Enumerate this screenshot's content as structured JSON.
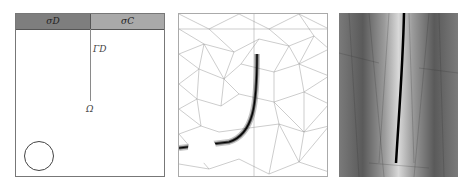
{
  "figure": {
    "panels": [
      {
        "id": "geometry",
        "description": "Domain geometry with boundary bands and crack line",
        "labels": {
          "band_left": "σD",
          "band_right": "σC",
          "crack": "ΓD",
          "domain": "Ω"
        }
      },
      {
        "id": "mesh",
        "description": "Adaptive triangular mesh refined along curved crack path from circular hole"
      },
      {
        "id": "field",
        "description": "Grayscale field plot with refined mesh along near-vertical crack"
      }
    ],
    "colors": {
      "band_dark": "#7e7e7e",
      "band_light": "#a9a9a9",
      "field_dark": "#5a5a5a",
      "field_light": "#d8d8d8",
      "crack": "#111111"
    }
  }
}
